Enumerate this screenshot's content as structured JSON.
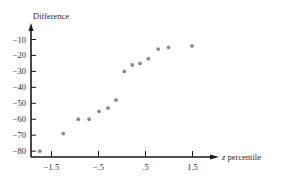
{
  "chart_data": {
    "type": "scatter",
    "title": "",
    "xlabel": "z percentile",
    "ylabel": "Difference",
    "xlim": [
      -2.0,
      1.9
    ],
    "ylim": [
      -82,
      -5
    ],
    "x_ticks": [
      -1.5,
      -0.5,
      0.5,
      1.5
    ],
    "x_tick_labels": [
      "-1.5",
      "-.5",
      ".5",
      "1.5"
    ],
    "y_ticks": [
      -10,
      -20,
      -30,
      -40,
      -50,
      -60,
      -70,
      -80
    ],
    "y_tick_labels": [
      "-10",
      "-20",
      "-30",
      "-40",
      "-50",
      "-60",
      "-70",
      "-80"
    ],
    "grid": false,
    "legend": null,
    "point_color": "#8a8a8a",
    "series": [
      {
        "name": "Difference vs z percentile",
        "x": [
          -1.75,
          -1.25,
          -0.93,
          -0.7,
          -0.49,
          -0.3,
          -0.13,
          0.05,
          0.22,
          0.38,
          0.56,
          0.77,
          0.99,
          1.49
        ],
        "y": [
          -80,
          -69,
          -60,
          -60,
          -55,
          -53,
          -48,
          -30,
          -26,
          -25,
          -22,
          -16,
          -15,
          -14
        ]
      }
    ]
  }
}
